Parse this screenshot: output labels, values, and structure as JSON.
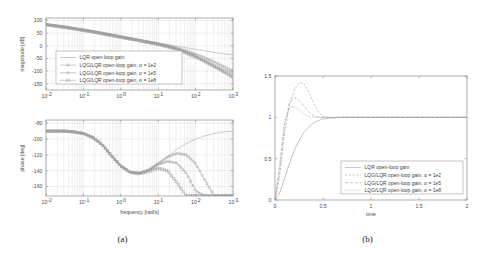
{
  "figure": {
    "panels": [
      {
        "caption": "(a)",
        "type": "bode",
        "subplots": [
          {
            "name": "magnitude",
            "ylabel": "magnitude [dB]",
            "xlabel": "",
            "ytick_labels": [
              "100",
              "50",
              "0",
              "-50",
              "-100",
              "-150"
            ],
            "ytick_values": [
              100,
              50,
              0,
              -50,
              -100,
              -150
            ],
            "ylim": [
              -175,
              110
            ],
            "xtick_labels": [
              "10",
              "10",
              "10",
              "10",
              "10",
              "10"
            ],
            "xtick_exponents": [
              "-2",
              "-1",
              "0",
              "1",
              "2",
              "3"
            ],
            "xlim_log10": [
              -2,
              3
            ],
            "grid": true
          },
          {
            "name": "phase",
            "ylabel": "phase [deg]",
            "xlabel": "frequency [rad/s]",
            "ytick_labels": [
              "-80",
              "-100",
              "-120",
              "-140",
              "-160"
            ],
            "ytick_values": [
              -80,
              -100,
              -120,
              -140,
              -160
            ],
            "ylim": [
              -172,
              -76
            ],
            "xtick_labels": [
              "10",
              "10",
              "10",
              "10",
              "10",
              "10"
            ],
            "xtick_exponents": [
              "-2",
              "-1",
              "0",
              "1",
              "2",
              "3"
            ],
            "xlim_log10": [
              -2,
              3
            ],
            "grid": true
          }
        ],
        "legend": {
          "position": "middle-left",
          "entries": [
            {
              "label": "LQR open-loop gain",
              "style": "solid",
              "marker": "none"
            },
            {
              "label": "LQG/LQR open-loop gain, σ = 1e2",
              "style": "solid",
              "marker": "circle"
            },
            {
              "label": "LQG/LQR open-loop gain, σ = 1e5",
              "style": "solid",
              "marker": "triangle"
            },
            {
              "label": "LQG/LQR open-loop gain, σ = 1e8",
              "style": "solid",
              "marker": "square"
            }
          ]
        }
      },
      {
        "caption": "(b)",
        "type": "step",
        "ylabel": "",
        "xlabel": "time",
        "ytick_labels": [
          "0",
          "0.5",
          "1",
          "1.5"
        ],
        "ytick_values": [
          0,
          0.5,
          1,
          1.5
        ],
        "ylim": [
          0,
          1.5
        ],
        "xtick_labels": [
          "0",
          "0.5",
          "1",
          "1.5",
          "2"
        ],
        "xtick_values": [
          0,
          0.5,
          1,
          1.5,
          2
        ],
        "xlim": [
          0,
          2
        ],
        "grid": false,
        "legend": {
          "position": "lower-right",
          "entries": [
            {
              "label": "LQR open-loop gain",
              "style": "solid",
              "marker": "none"
            },
            {
              "label": "LQG/LQR open-loop gain, σ = 1e2",
              "style": "dashed",
              "marker": "none"
            },
            {
              "label": "LQG/LQR open-loop gain, σ = 1e5",
              "style": "dashed",
              "marker": "none"
            },
            {
              "label": "LQG/LQR open-loop gain, σ = 1e8",
              "style": "dashed",
              "marker": "none"
            }
          ]
        }
      }
    ]
  },
  "chart_data": [
    {
      "type": "line",
      "name": "bode-magnitude",
      "title": "",
      "xlabel": "",
      "ylabel": "magnitude [dB]",
      "xscale": "log",
      "xlim": [
        0.01,
        1000
      ],
      "ylim": [
        -175,
        110
      ],
      "grid": true,
      "legend_position": "middle-left",
      "x": [
        0.01,
        0.0178,
        0.0316,
        0.0562,
        0.1,
        0.178,
        0.316,
        0.562,
        1,
        1.78,
        3.16,
        5.62,
        10,
        17.8,
        31.6,
        56.2,
        100,
        178,
        316,
        562,
        1000
      ],
      "series": [
        {
          "name": "LQR open-loop gain",
          "values": [
            88,
            83,
            78,
            72,
            66,
            60,
            53,
            46,
            39,
            32,
            25,
            18,
            11,
            4.5,
            -2,
            -8,
            -14,
            -20,
            -26,
            -31,
            -36
          ]
        },
        {
          "name": "LQG/LQR open-loop gain, σ = 1e2",
          "values": [
            85,
            80,
            75,
            69,
            63,
            57,
            50,
            43,
            36,
            29,
            22,
            15,
            8,
            0,
            -9,
            -20,
            -33,
            -48,
            -64,
            -82,
            -101
          ]
        },
        {
          "name": "LQG/LQR open-loop gain, σ = 1e5",
          "values": [
            84,
            79,
            74,
            68,
            62,
            56,
            49,
            42,
            35,
            28,
            21,
            14,
            6.5,
            -2,
            -12,
            -25,
            -42,
            -61,
            -82,
            -104,
            -126
          ]
        },
        {
          "name": "LQG/LQR open-loop gain, σ = 1e8",
          "values": [
            83,
            78,
            73,
            67,
            61,
            55,
            48,
            41,
            34,
            27,
            20,
            13,
            5.5,
            -3.5,
            -14,
            -28,
            -44,
            -62,
            -80,
            -98,
            -116
          ]
        }
      ]
    },
    {
      "type": "line",
      "name": "bode-phase",
      "title": "",
      "xlabel": "frequency [rad/s]",
      "ylabel": "phase [deg]",
      "xscale": "log",
      "xlim": [
        0.01,
        1000
      ],
      "ylim": [
        -172,
        -76
      ],
      "grid": true,
      "x": [
        0.01,
        0.0178,
        0.0316,
        0.0562,
        0.1,
        0.178,
        0.316,
        0.562,
        1,
        1.78,
        3.16,
        5.62,
        10,
        17.8,
        31.6,
        56.2,
        100,
        178,
        316,
        562,
        1000
      ],
      "series": [
        {
          "name": "LQR open-loop gain",
          "values": [
            -90,
            -90,
            -90,
            -91,
            -93,
            -98,
            -107,
            -121,
            -134,
            -142,
            -143,
            -139,
            -131,
            -122,
            -113,
            -106,
            -100,
            -96,
            -93,
            -91,
            -90
          ]
        },
        {
          "name": "LQG/LQR open-loop gain, σ = 1e2",
          "values": [
            -90,
            -90,
            -90,
            -91,
            -93,
            -98,
            -107,
            -121,
            -134,
            -142,
            -143,
            -139,
            -131,
            -123,
            -118,
            -120,
            -131,
            -152,
            -172,
            -172,
            -172
          ]
        },
        {
          "name": "LQG/LQR open-loop gain, σ = 1e5",
          "values": [
            -90,
            -90,
            -90,
            -91,
            -93,
            -98,
            -107,
            -121,
            -134,
            -142,
            -143,
            -139,
            -132,
            -128,
            -130,
            -143,
            -165,
            -172,
            -172,
            -172,
            -172
          ]
        },
        {
          "name": "LQG/LQR open-loop gain, σ = 1e8",
          "values": [
            -90,
            -90,
            -90,
            -91,
            -93,
            -98,
            -107,
            -121,
            -134,
            -142,
            -144,
            -141,
            -137,
            -140,
            -155,
            -172,
            -172,
            -172,
            -172,
            -172,
            -172
          ]
        }
      ]
    },
    {
      "type": "line",
      "name": "step-response",
      "title": "",
      "xlabel": "time",
      "ylabel": "",
      "xscale": "linear",
      "xlim": [
        0,
        2
      ],
      "ylim": [
        0,
        1.5
      ],
      "grid": false,
      "legend_position": "lower-right",
      "x": [
        0,
        0.05,
        0.1,
        0.15,
        0.2,
        0.25,
        0.3,
        0.35,
        0.4,
        0.45,
        0.5,
        0.6,
        0.7,
        0.8,
        1.0,
        1.5,
        2.0
      ],
      "series": [
        {
          "name": "LQR open-loop gain",
          "values": [
            0,
            0.09,
            0.26,
            0.44,
            0.6,
            0.72,
            0.82,
            0.88,
            0.93,
            0.96,
            0.98,
            0.995,
            1.0,
            1.0,
            1.0,
            1.0,
            1.0
          ]
        },
        {
          "name": "LQG/LQR open-loop gain, σ = 1e2",
          "values": [
            0,
            0.3,
            0.8,
            1.15,
            1.33,
            1.42,
            1.41,
            1.31,
            1.18,
            1.07,
            1.01,
            0.99,
            1.0,
            1.0,
            1.0,
            1.0,
            1.0
          ]
        },
        {
          "name": "LQG/LQR open-loop gain, σ = 1e5",
          "values": [
            0,
            0.38,
            0.9,
            1.17,
            1.24,
            1.21,
            1.14,
            1.07,
            1.02,
            1.0,
            1.0,
            1.0,
            1.0,
            1.0,
            1.0,
            1.0,
            1.0
          ]
        },
        {
          "name": "LQG/LQR open-loop gain, σ = 1e8",
          "values": [
            0,
            0.45,
            0.95,
            1.12,
            1.13,
            1.09,
            1.04,
            1.01,
            1.0,
            1.0,
            1.0,
            1.0,
            1.0,
            1.0,
            1.0,
            1.0,
            1.0
          ]
        }
      ]
    }
  ]
}
